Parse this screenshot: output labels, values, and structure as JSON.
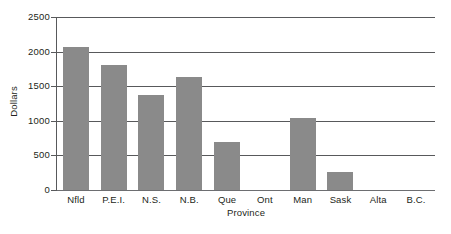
{
  "chart_data": {
    "type": "bar",
    "title": "",
    "subtitle": "",
    "xlabel": "Province",
    "ylabel": "Dollars",
    "categories": [
      "Nfld",
      "P.E.I.",
      "N.S.",
      "N.B.",
      "Que",
      "Ont",
      "Man",
      "Sask",
      "Alta",
      "B.C."
    ],
    "values": [
      2060,
      1800,
      1380,
      1630,
      690,
      0,
      1040,
      260,
      0,
      0
    ],
    "ylim": [
      0,
      2500
    ],
    "yticks": [
      0,
      500,
      1000,
      1500,
      2000,
      2500
    ],
    "ytick_labels": [
      "0",
      "500",
      "1000",
      "1500",
      "2000",
      "2500"
    ],
    "grid": true,
    "legend": false,
    "legend_position": "none",
    "bar_color": "#8a8a8a",
    "axis_color": "#58595b",
    "text_color": "#231f20",
    "background": "#ffffff"
  }
}
